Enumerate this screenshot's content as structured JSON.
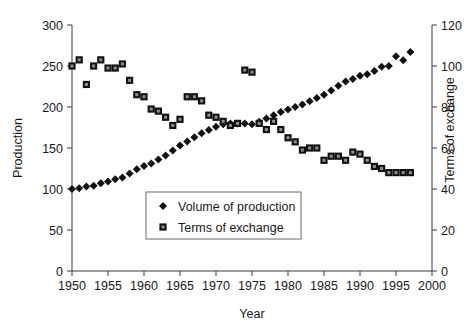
{
  "chart_data": {
    "type": "scatter",
    "title": "",
    "xlabel": "Year",
    "ylabel": "Production",
    "y2label": "Terms of exchange",
    "xlim": [
      1950,
      2000
    ],
    "ylim": [
      0,
      300
    ],
    "y2lim": [
      0,
      120
    ],
    "grid": false,
    "legend_position": "center-bottom-inside",
    "x_ticks": [
      1950,
      1955,
      1960,
      1965,
      1970,
      1975,
      1980,
      1985,
      1990,
      1995,
      2000
    ],
    "y_ticks": [
      0,
      50,
      100,
      150,
      200,
      250,
      300
    ],
    "y2_ticks": [
      0,
      20,
      40,
      60,
      80,
      100,
      120
    ],
    "series": [
      {
        "name": "Volume of production",
        "marker": "diamond",
        "axis": "left",
        "color": "#111111",
        "x": [
          1950,
          1951,
          1952,
          1953,
          1954,
          1955,
          1956,
          1957,
          1958,
          1959,
          1960,
          1961,
          1962,
          1963,
          1964,
          1965,
          1966,
          1967,
          1968,
          1969,
          1970,
          1971,
          1972,
          1973,
          1974,
          1975,
          1976,
          1977,
          1978,
          1979,
          1980,
          1981,
          1982,
          1983,
          1984,
          1985,
          1986,
          1987,
          1988,
          1989,
          1990,
          1991,
          1992,
          1993,
          1994,
          1995,
          1996,
          1997
        ],
        "values": [
          100,
          101,
          103,
          104,
          107,
          109,
          112,
          114,
          119,
          124,
          128,
          131,
          136,
          141,
          147,
          153,
          158,
          163,
          168,
          172,
          176,
          179,
          180,
          180,
          180,
          179,
          182,
          186,
          190,
          194,
          197,
          200,
          203,
          207,
          211,
          215,
          220,
          226,
          231,
          234,
          238,
          240,
          244,
          249,
          250,
          262,
          257,
          267
        ]
      },
      {
        "name": "Terms of exchange",
        "marker": "square",
        "axis": "right",
        "color": "#111111",
        "x": [
          1950,
          1951,
          1952,
          1953,
          1954,
          1955,
          1956,
          1957,
          1958,
          1959,
          1960,
          1961,
          1962,
          1963,
          1964,
          1965,
          1966,
          1967,
          1968,
          1969,
          1970,
          1971,
          1972,
          1973,
          1974,
          1975,
          1976,
          1977,
          1978,
          1979,
          1980,
          1981,
          1982,
          1983,
          1984,
          1985,
          1986,
          1987,
          1988,
          1989,
          1990,
          1991,
          1992,
          1993,
          1994,
          1995,
          1996,
          1997
        ],
        "values": [
          100,
          103,
          91,
          100,
          103,
          99,
          99,
          101,
          93,
          86,
          85,
          79,
          78,
          75,
          71,
          74,
          85,
          85,
          83,
          76,
          75,
          73,
          71,
          72,
          98,
          97,
          72,
          69,
          73,
          69,
          65,
          63,
          59,
          60,
          60,
          54,
          56,
          56,
          54,
          58,
          57,
          54,
          51,
          50,
          48,
          48,
          48,
          48
        ]
      }
    ],
    "legend_entries": [
      {
        "label": "Volume of production",
        "marker": "diamond"
      },
      {
        "label": "Terms of exchange",
        "marker": "square"
      }
    ]
  }
}
